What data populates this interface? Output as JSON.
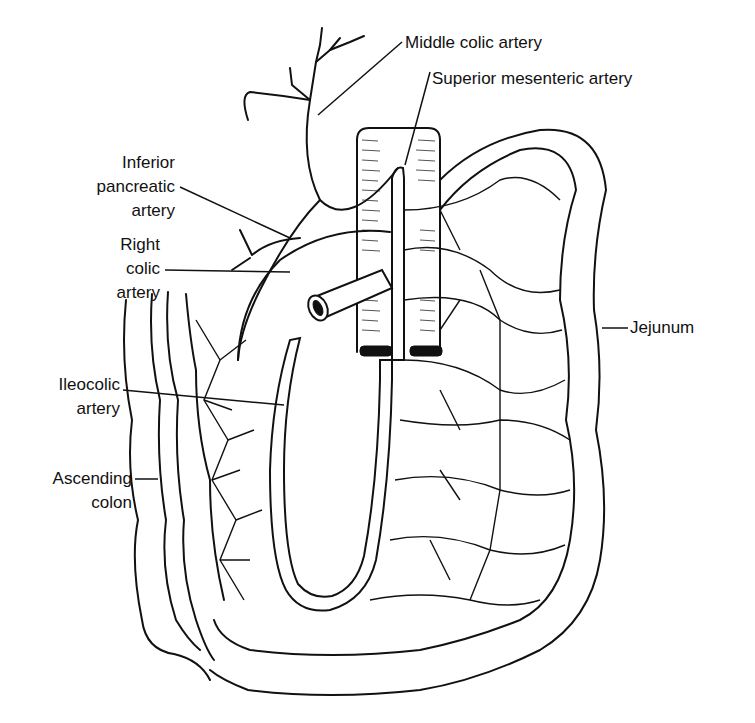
{
  "figure": {
    "colors": {
      "line": "#111111",
      "background": "#ffffff"
    }
  },
  "labels": {
    "middle_colic": "Middle colic artery",
    "sma": "Superior mesenteric artery",
    "inferior_pancreatic": {
      "line1": "Inferior",
      "line2": "pancreatic",
      "line3": "artery"
    },
    "right_colic": {
      "line1": "Right",
      "line2": "colic",
      "line3": "artery"
    },
    "ileocolic": {
      "line1": "Ileocolic",
      "line2": "artery"
    },
    "ascending_colon": {
      "line1": "Ascending",
      "line2": "colon"
    },
    "jejunum": "Jejunum"
  }
}
